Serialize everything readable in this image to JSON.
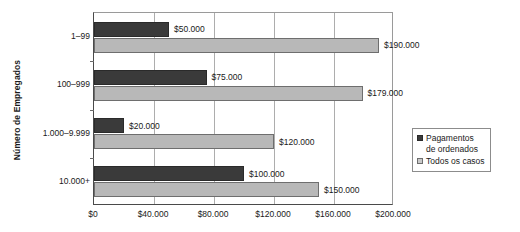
{
  "chart_data": {
    "type": "bar",
    "orientation": "horizontal",
    "title": "",
    "xlabel": "",
    "ylabel": "Número de Empregados",
    "xlim": [
      0,
      200000
    ],
    "xticks": [
      0,
      40000,
      80000,
      120000,
      160000,
      200000
    ],
    "xtick_labels": [
      "$0",
      "$40.000",
      "$80.000",
      "$120.000",
      "$160.000",
      "$200.000"
    ],
    "grid": "vertical",
    "legend_position": "right-middle",
    "categories": [
      "1–99",
      "100–999",
      "1.000–9.999",
      "10.000+"
    ],
    "series": [
      {
        "name": "Pagamentos de ordenados",
        "color": "#3a3a3a",
        "values": [
          50000,
          75000,
          20000,
          100000
        ],
        "labels": [
          "$50.000",
          "$75.000",
          "$20.000",
          "$100.000"
        ]
      },
      {
        "name": "Todos os casos",
        "color": "#b8b8b8",
        "values": [
          190000,
          179000,
          120000,
          150000
        ],
        "labels": [
          "$190.000",
          "$179.000",
          "$120.000",
          "$150.000"
        ]
      }
    ]
  },
  "legend": {
    "items": [
      {
        "label": "Pagamentos\nde ordenados",
        "swatch": "dark"
      },
      {
        "label": "Todos os casos",
        "swatch": "light"
      }
    ]
  }
}
